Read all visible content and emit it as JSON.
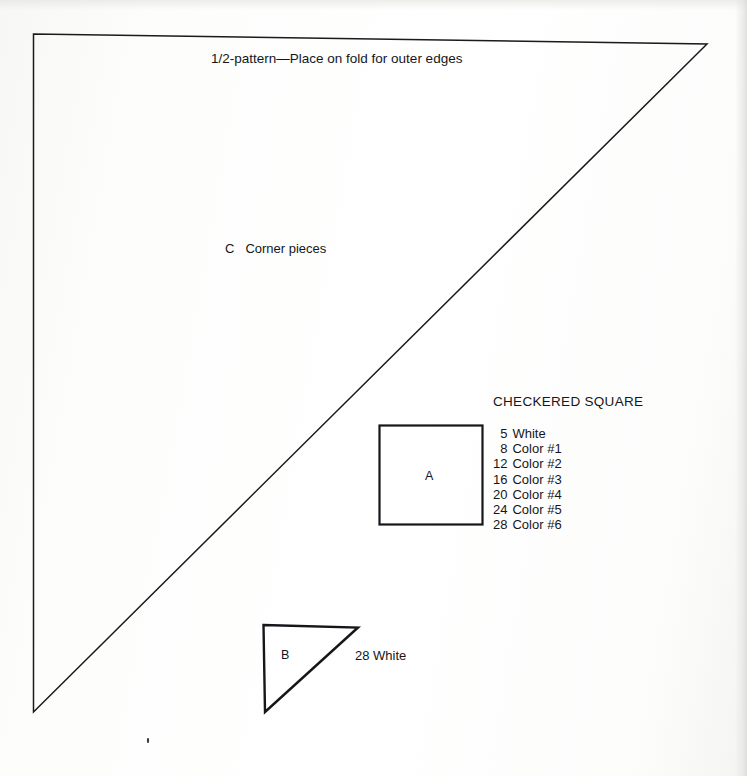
{
  "document": {
    "title": "1/2-pattern—Place on fold for outer edges"
  },
  "pieces": {
    "corner": {
      "code": "C",
      "name": "Corner pieces"
    },
    "square_a": {
      "code": "A"
    },
    "triangle_b": {
      "code": "B",
      "quantity_label": "28 White"
    }
  },
  "legend": {
    "title": "CHECKERED SQUARE",
    "rows": [
      {
        "qty": "5",
        "name": "White"
      },
      {
        "qty": "8",
        "name": "Color #1"
      },
      {
        "qty": "12",
        "name": "Color #2"
      },
      {
        "qty": "16",
        "name": "Color #3"
      },
      {
        "qty": "20",
        "name": "Color #4"
      },
      {
        "qty": "24",
        "name": "Color #5"
      },
      {
        "qty": "28",
        "name": "Color #6"
      }
    ]
  },
  "colors": {
    "ink": "#15161a",
    "line": "#1b1b1d",
    "paper": "#fefefe"
  }
}
